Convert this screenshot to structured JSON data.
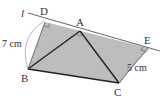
{
  "figure": {
    "type": "geometry-diagram",
    "line_label": "l",
    "points": {
      "D": {
        "label": "D",
        "x": 45,
        "y": 22
      },
      "A": {
        "label": "A",
        "x": 80,
        "y": 31
      },
      "E": {
        "label": "E",
        "x": 148,
        "y": 48
      },
      "B": {
        "label": "B",
        "x": 28,
        "y": 69
      },
      "C": {
        "label": "C",
        "x": 119,
        "y": 83
      }
    },
    "measurements": {
      "BD": "7 cm",
      "CE": "5 cm"
    },
    "right_angles": [
      "D",
      "A",
      "E"
    ],
    "colors": {
      "fill": "#bdbdbd",
      "stroke": "#333333",
      "line": "#555555",
      "text": "#333333"
    }
  }
}
